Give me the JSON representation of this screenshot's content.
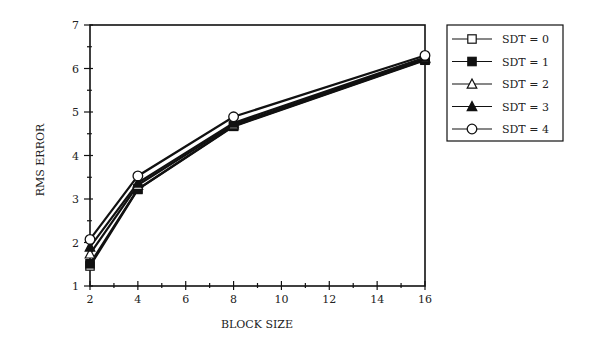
{
  "chart_data": {
    "type": "line",
    "title": "",
    "xlabel": "BLOCK SIZE",
    "ylabel": "RMS ERROR",
    "x": [
      2,
      4,
      8,
      16
    ],
    "xlim": [
      2,
      16
    ],
    "ylim": [
      1,
      7
    ],
    "xticks": [
      2,
      4,
      6,
      8,
      10,
      12,
      14,
      16
    ],
    "yticks": [
      1,
      2,
      3,
      4,
      5,
      6,
      7
    ],
    "grid": false,
    "legend_position": "right-outside-top",
    "series": [
      {
        "name": "SDT = 0",
        "marker": "square-open",
        "values": [
          1.46,
          3.22,
          4.67,
          6.19
        ]
      },
      {
        "name": "SDT = 1",
        "marker": "square-filled",
        "values": [
          1.51,
          3.23,
          4.68,
          6.2
        ]
      },
      {
        "name": "SDT = 2",
        "marker": "triangle-open",
        "values": [
          1.74,
          3.32,
          4.71,
          6.23
        ]
      },
      {
        "name": "SDT = 3",
        "marker": "triangle-filled",
        "values": [
          1.9,
          3.37,
          4.75,
          6.25
        ]
      },
      {
        "name": "SDT = 4",
        "marker": "circle-open",
        "values": [
          2.07,
          3.53,
          4.89,
          6.3
        ]
      }
    ]
  },
  "colors": {
    "line": "#111111",
    "background": "#ffffff",
    "text": "#222222"
  }
}
